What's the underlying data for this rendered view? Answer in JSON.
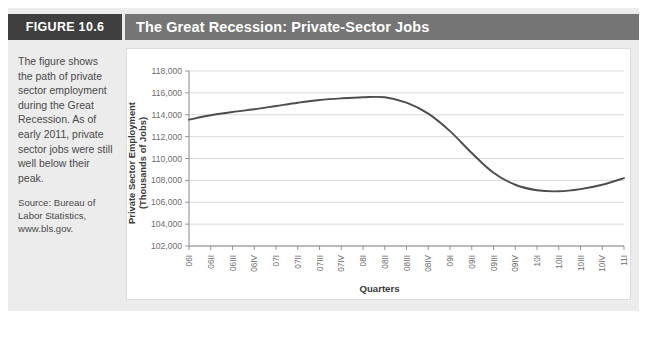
{
  "figure": {
    "number_label": "FIGURE 10.6",
    "title": "The Great Recession: Private-Sector Jobs",
    "caption": "The figure shows the path of private sector employment during the Great Recession. As of early 2011, private sector jobs were still well below their peak.",
    "source": "Source: Bureau of Labor Statistics, www.bls.gov."
  },
  "colors": {
    "panel_background": "#ececec",
    "figure_number_background": "#3f3f3f",
    "title_background": "#757575",
    "title_text": "#ffffff",
    "chart_background": "#ffffff",
    "line": "#4d4d4d",
    "gridline": "#cfcfcf",
    "axis": "#8a8a8a",
    "caption_text": "#4a4a4a"
  },
  "chart_data": {
    "type": "line",
    "title": "The Great Recession: Private-Sector Jobs",
    "xlabel": "Quarters",
    "ylabel": "Private Sector Employment\n(Thousands of Jobs)",
    "ylim": [
      102000,
      118000
    ],
    "yticks": [
      102000,
      104000,
      106000,
      108000,
      110000,
      112000,
      114000,
      116000,
      118000
    ],
    "ytick_labels": [
      "102,000",
      "104,000",
      "106,000",
      "108,000",
      "110,000",
      "112,000",
      "114,000",
      "116,000",
      "118,000"
    ],
    "grid": true,
    "legend": "none",
    "categories": [
      "06I",
      "06II",
      "06III",
      "06IV",
      "07I",
      "07II",
      "07III",
      "07IV",
      "08I",
      "08II",
      "08III",
      "08IV",
      "09I",
      "09II",
      "09III",
      "09IV",
      "10I",
      "10II",
      "10III",
      "10IV",
      "11I"
    ],
    "series": [
      {
        "name": "Private Sector Employment",
        "values": [
          113550,
          113950,
          114250,
          114500,
          114800,
          115100,
          115350,
          115500,
          115600,
          115600,
          115100,
          114100,
          112500,
          110500,
          108700,
          107600,
          107100,
          107000,
          107200,
          107600,
          108200
        ]
      }
    ]
  }
}
